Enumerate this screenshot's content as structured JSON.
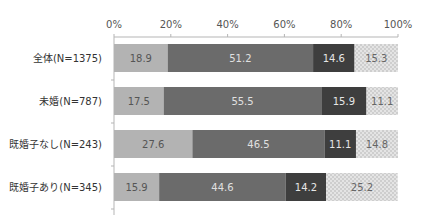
{
  "chart_data": {
    "type": "bar",
    "orientation": "horizontal",
    "stacked": true,
    "title": "",
    "xlabel": "",
    "ylabel": "",
    "xlim": [
      0,
      100
    ],
    "x_ticks": [
      "0%",
      "20%",
      "40%",
      "60%",
      "80%",
      "100%"
    ],
    "categories": [
      "全体(N=1375)",
      "未婚(N=787)",
      "既婚子なし(N=243)",
      "既婚子あり(N=345)"
    ],
    "series": [
      {
        "name": "series-1",
        "color": "#b3b3b3",
        "label_color": "#555555",
        "values": [
          18.9,
          17.5,
          27.6,
          15.9
        ]
      },
      {
        "name": "series-2",
        "color": "#6b6b6b",
        "label_color": "#e0e0e0",
        "values": [
          51.2,
          55.5,
          46.5,
          44.6
        ]
      },
      {
        "name": "series-3",
        "color": "#3e3e3e",
        "label_color": "#e6e6e6",
        "values": [
          14.6,
          15.9,
          11.1,
          14.2
        ]
      },
      {
        "name": "series-4",
        "color": "#dcdcdc",
        "label_color": "#666666",
        "pattern": "dotted",
        "values": [
          15.3,
          11.1,
          14.8,
          25.2
        ]
      }
    ],
    "grid": false,
    "legend": "none"
  }
}
